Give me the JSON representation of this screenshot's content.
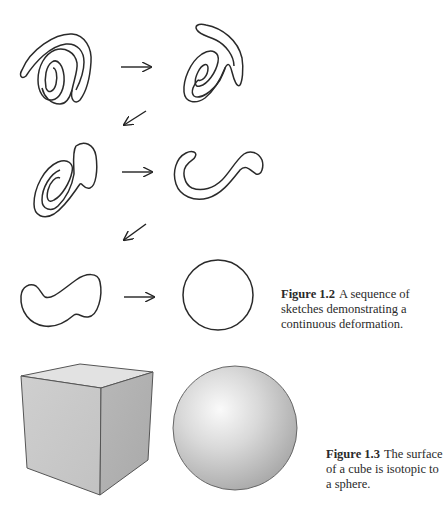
{
  "figure_1_2": {
    "label": "Figure 1.2",
    "caption": "A sequence of sketches demonstrating a continuous deformation.",
    "steps": [
      {
        "name": "double-spiral"
      },
      {
        "name": "spiral-with-tail"
      },
      {
        "name": "curled-loop"
      },
      {
        "name": "hook-shape"
      },
      {
        "name": "kidney-blob"
      },
      {
        "name": "circle"
      }
    ],
    "arrow_color": "#222222"
  },
  "figure_1_3": {
    "label": "Figure 1.3",
    "caption": "The surface of a cube is isotopic to a sphere.",
    "objects": [
      "cube",
      "sphere"
    ]
  }
}
